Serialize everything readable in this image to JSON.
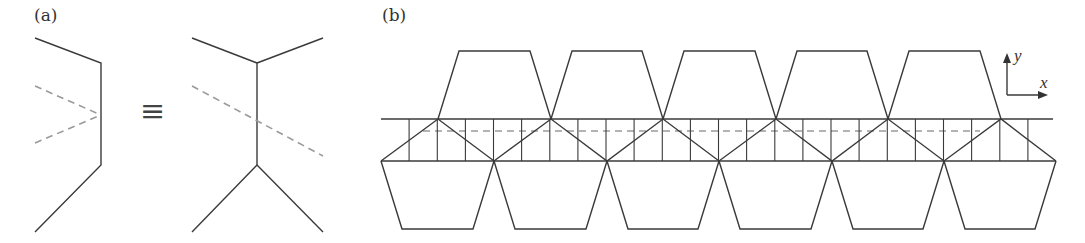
{
  "panels": {
    "a": {
      "label": "(a)",
      "equivalence_symbol": "≡",
      "left_figure": {
        "description": "bent chain with two crossing dashed lines meeting at vertical segment",
        "solid_path": [
          [
            35,
            38
          ],
          [
            101,
            63
          ],
          [
            101,
            165
          ],
          [
            35,
            232
          ]
        ],
        "dashed_lines": [
          [
            [
              35,
              86
            ],
            [
              101,
              115
            ]
          ],
          [
            [
              35,
              143
            ],
            [
              101,
              115
            ]
          ]
        ]
      },
      "right_figure": {
        "description": "double Y-junction connected by vertical segment, single dashed line crossing",
        "top_junction": [
          257,
          63
        ],
        "bottom_junction": [
          257,
          165
        ],
        "branches": [
          [
            [
              192,
              38
            ],
            [
              257,
              63
            ]
          ],
          [
            [
              323,
              38
            ],
            [
              257,
              63
            ]
          ],
          [
            [
              192,
              232
            ],
            [
              257,
              165
            ]
          ],
          [
            [
              323,
              232
            ],
            [
              257,
              165
            ]
          ]
        ],
        "dashed_line": [
          [
            192,
            86
          ],
          [
            323,
            156
          ]
        ]
      }
    },
    "b": {
      "label": "(b)",
      "strip": {
        "top_y": 119,
        "bottom_y": 161,
        "dashed_y": 131,
        "top_line_x": [
          381,
          1053
        ],
        "bottom_line_x": [
          381,
          1056
        ],
        "dashed_x": [
          423,
          980
        ]
      },
      "period": 112.5,
      "upper_apex_x": [
        438,
        551,
        663,
        776,
        888,
        1001
      ],
      "lower_vertex_x": [
        381,
        494,
        607,
        719,
        832,
        944,
        1056
      ],
      "top_trapezoid": {
        "count": 5,
        "top_y": 51,
        "inset": 21
      },
      "bottom_trapezoid": {
        "count": 6,
        "bottom_y": 229,
        "inset": 21
      },
      "vertical_ticks_spacing": 28.125,
      "axes": {
        "origin": [
          1007,
          95
        ],
        "y_tip": [
          1007,
          53
        ],
        "x_tip": [
          1048,
          95
        ],
        "x_label": "x",
        "y_label": "y"
      }
    }
  },
  "colors": {
    "line": "#3a3a3a",
    "dashed": "#9a9a9a",
    "text": "#333333",
    "background": "#ffffff"
  }
}
